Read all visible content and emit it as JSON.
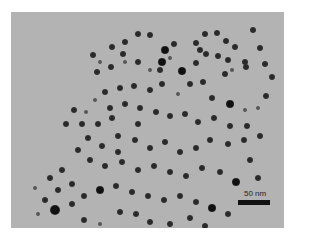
{
  "image": {
    "type": "TEM micrograph",
    "background_color": "#b3b3b3",
    "particle_color": "#1a1a1a"
  },
  "scale_bar": {
    "label": "50 nm"
  },
  "particles": [
    [
      93,
      55,
      3
    ],
    [
      100,
      62,
      2
    ],
    [
      97,
      72,
      3
    ],
    [
      112,
      47,
      3
    ],
    [
      125,
      42,
      3
    ],
    [
      138,
      34,
      3
    ],
    [
      150,
      35,
      3
    ],
    [
      165,
      50,
      4
    ],
    [
      174,
      44,
      3
    ],
    [
      160,
      70,
      3
    ],
    [
      123,
      54,
      3
    ],
    [
      111,
      67,
      3
    ],
    [
      125,
      62,
      2
    ],
    [
      138,
      62,
      3
    ],
    [
      150,
      70,
      2
    ],
    [
      162,
      62,
      4
    ],
    [
      170,
      58,
      2
    ],
    [
      182,
      71,
      4
    ],
    [
      196,
      43,
      3
    ],
    [
      205,
      34,
      3
    ],
    [
      217,
      33,
      3
    ],
    [
      226,
      41,
      3
    ],
    [
      235,
      47,
      3
    ],
    [
      253,
      30,
      3
    ],
    [
      260,
      48,
      3
    ],
    [
      196,
      63,
      3
    ],
    [
      206,
      54,
      3
    ],
    [
      218,
      56,
      3
    ],
    [
      228,
      60,
      3
    ],
    [
      245,
      62,
      3
    ],
    [
      200,
      50,
      3
    ],
    [
      232,
      70,
      2
    ],
    [
      203,
      82,
      3
    ],
    [
      225,
      74,
      3
    ],
    [
      246,
      67,
      3
    ],
    [
      265,
      64,
      3
    ],
    [
      272,
      77,
      3
    ],
    [
      212,
      98,
      3
    ],
    [
      230,
      104,
      4
    ],
    [
      245,
      110,
      2
    ],
    [
      258,
      108,
      2
    ],
    [
      266,
      96,
      3
    ],
    [
      190,
      84,
      3
    ],
    [
      178,
      94,
      2
    ],
    [
      162,
      84,
      3
    ],
    [
      150,
      90,
      3
    ],
    [
      134,
      86,
      3
    ],
    [
      120,
      88,
      3
    ],
    [
      105,
      92,
      3
    ],
    [
      95,
      100,
      2
    ],
    [
      110,
      108,
      3
    ],
    [
      125,
      104,
      3
    ],
    [
      140,
      108,
      3
    ],
    [
      156,
      112,
      3
    ],
    [
      170,
      116,
      3
    ],
    [
      185,
      114,
      3
    ],
    [
      198,
      122,
      3
    ],
    [
      214,
      118,
      3
    ],
    [
      230,
      126,
      3
    ],
    [
      247,
      126,
      3
    ],
    [
      260,
      136,
      3
    ],
    [
      244,
      140,
      3
    ],
    [
      228,
      144,
      3
    ],
    [
      210,
      140,
      3
    ],
    [
      196,
      148,
      3
    ],
    [
      180,
      152,
      3
    ],
    [
      165,
      142,
      3
    ],
    [
      150,
      148,
      3
    ],
    [
      135,
      140,
      3
    ],
    [
      118,
      136,
      3
    ],
    [
      102,
      146,
      3
    ],
    [
      88,
      138,
      3
    ],
    [
      78,
      150,
      3
    ],
    [
      90,
      160,
      3
    ],
    [
      105,
      166,
      3
    ],
    [
      122,
      162,
      3
    ],
    [
      138,
      170,
      3
    ],
    [
      154,
      166,
      3
    ],
    [
      170,
      172,
      3
    ],
    [
      186,
      176,
      3
    ],
    [
      202,
      168,
      3
    ],
    [
      220,
      172,
      3
    ],
    [
      236,
      182,
      4
    ],
    [
      258,
      178,
      3
    ],
    [
      250,
      160,
      3
    ],
    [
      62,
      170,
      3
    ],
    [
      50,
      178,
      3
    ],
    [
      58,
      190,
      3
    ],
    [
      72,
      184,
      3
    ],
    [
      45,
      200,
      3
    ],
    [
      55,
      210,
      5
    ],
    [
      72,
      204,
      3
    ],
    [
      84,
      196,
      3
    ],
    [
      100,
      190,
      4
    ],
    [
      116,
      186,
      3
    ],
    [
      132,
      192,
      3
    ],
    [
      148,
      196,
      3
    ],
    [
      164,
      200,
      3
    ],
    [
      180,
      196,
      3
    ],
    [
      196,
      202,
      3
    ],
    [
      212,
      208,
      4
    ],
    [
      228,
      214,
      3
    ],
    [
      120,
      212,
      3
    ],
    [
      136,
      214,
      3
    ],
    [
      84,
      220,
      3
    ],
    [
      100,
      224,
      2
    ],
    [
      38,
      214,
      2
    ],
    [
      35,
      188,
      2
    ],
    [
      150,
      222,
      3
    ],
    [
      170,
      224,
      3
    ],
    [
      190,
      218,
      3
    ],
    [
      205,
      226,
      3
    ],
    [
      112,
      118,
      3
    ],
    [
      98,
      124,
      3
    ],
    [
      82,
      124,
      3
    ],
    [
      66,
      124,
      3
    ],
    [
      118,
      152,
      3
    ],
    [
      74,
      110,
      3
    ],
    [
      86,
      112,
      2
    ],
    [
      138,
      124,
      3
    ]
  ]
}
